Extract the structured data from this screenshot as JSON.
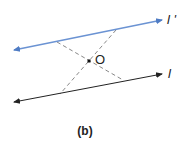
{
  "diagram": {
    "line_top_label": "l '",
    "line_bottom_label": "l",
    "point_label": "O",
    "caption": "(b)",
    "colors": {
      "line_top": "#5b86c9",
      "line_bottom": "#222222",
      "dashed": "#888888"
    }
  }
}
